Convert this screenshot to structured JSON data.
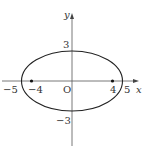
{
  "diagram": {
    "type": "ellipse-on-axes",
    "equation": "x^2/25 + y^2/9 = 1",
    "semi_major_a": 5,
    "semi_minor_b": 3,
    "foci": [
      [
        -4,
        0
      ],
      [
        4,
        0
      ]
    ],
    "colors": {
      "stroke": "#222222",
      "axis": "#444444",
      "text": "#333333",
      "background": "#ffffff"
    }
  },
  "axes": {
    "x_label": "x",
    "y_label": "y",
    "origin_label": "O"
  },
  "labels": {
    "x_neg5": "−5",
    "x_neg4": "−4",
    "x_pos4": "4",
    "x_pos5": "5",
    "y_pos3": "3",
    "y_neg3": "−3"
  }
}
